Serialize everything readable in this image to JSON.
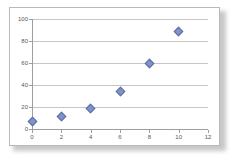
{
  "chart_data": {
    "type": "scatter",
    "title": "",
    "xlabel": "",
    "ylabel": "",
    "xlim": [
      0,
      12
    ],
    "ylim": [
      0,
      100
    ],
    "xticks": [
      0,
      2,
      4,
      6,
      8,
      10,
      12
    ],
    "yticks": [
      0,
      20,
      40,
      60,
      80,
      100
    ],
    "xtick_labels": [
      "0",
      "2",
      "4",
      "6",
      "8",
      "10",
      "12"
    ],
    "ytick_labels": [
      "0",
      "20",
      "40",
      "60",
      "80",
      "100"
    ],
    "grid": "horizontal",
    "legend": "none",
    "series": [
      {
        "name": "Series 1",
        "marker": "diamond",
        "color": "#8093c4",
        "edge_color": "#5d6ea6",
        "points": [
          {
            "x": 0,
            "y": 7
          },
          {
            "x": 2,
            "y": 11
          },
          {
            "x": 4,
            "y": 19
          },
          {
            "x": 6,
            "y": 34
          },
          {
            "x": 8,
            "y": 60
          },
          {
            "x": 10,
            "y": 89
          }
        ]
      }
    ]
  },
  "colors": {
    "marker_fill": "#8093c4",
    "marker_edge": "#5d6ea6",
    "gridline": "#c6c6c6",
    "axis": "#9e9e9e",
    "frame_border": "#b9b9b9",
    "plot_background": "#ffffff",
    "tick_text": "#565656"
  }
}
